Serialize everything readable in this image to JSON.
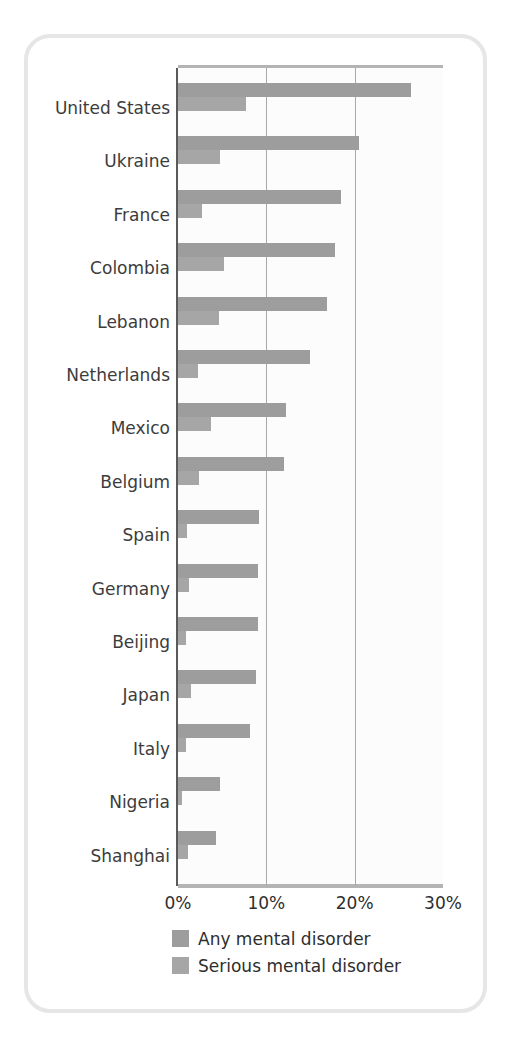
{
  "chart_data": {
    "type": "bar",
    "orientation": "horizontal",
    "title": "",
    "subtitle": "",
    "xlabel": "",
    "ylabel": "",
    "xlim": [
      0,
      30
    ],
    "xticks": [
      "0%",
      "10%",
      "20%",
      "30%"
    ],
    "xtick_values": [
      0,
      10,
      20,
      30
    ],
    "grid": "vertical",
    "legend_position": "bottom-left",
    "categories": [
      "United States",
      "Ukraine",
      "France",
      "Colombia",
      "Lebanon",
      "Netherlands",
      "Mexico",
      "Belgium",
      "Spain",
      "Germany",
      "Beijing",
      "Japan",
      "Italy",
      "Nigeria",
      "Shanghai"
    ],
    "series": [
      {
        "name": "Any mental disorder",
        "color": "#9d9d9d",
        "values": [
          26.4,
          20.5,
          18.4,
          17.8,
          16.9,
          14.9,
          12.2,
          12.0,
          9.2,
          9.1,
          9.1,
          8.8,
          8.2,
          4.7,
          4.3
        ]
      },
      {
        "name": "Serious mental disorder",
        "color": "#a6a6a6",
        "values": [
          7.7,
          4.8,
          2.7,
          5.2,
          4.6,
          2.3,
          3.7,
          2.4,
          1.0,
          1.2,
          0.9,
          1.5,
          0.9,
          0.4,
          1.1
        ]
      }
    ]
  },
  "legend": {
    "items": [
      {
        "label": "Any mental disorder",
        "color": "#9d9d9d"
      },
      {
        "label": "Serious mental disorder",
        "color": "#a6a6a6"
      }
    ]
  },
  "colors": {
    "any_disorder": "#9d9d9d",
    "serious_disorder": "#a6a6a6",
    "axis": "#5a5a5a",
    "gridline": "#a8a8a8",
    "frame": "#e6e6e6",
    "label_text": "#3c3c3c"
  }
}
